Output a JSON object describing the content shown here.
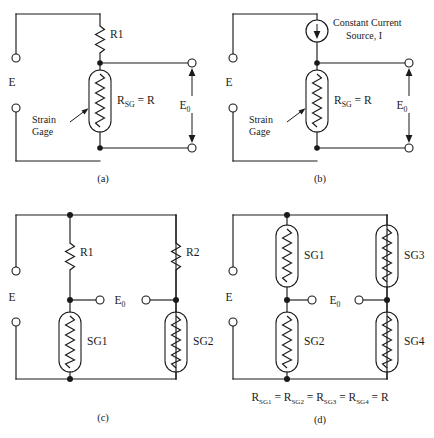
{
  "figure": {
    "background_color": "#ffffff",
    "line_color": "#1a1a1a"
  },
  "panels": [
    {
      "id": "a",
      "caption": "(a)",
      "supply_label": "E",
      "output_label": "E",
      "output_sub": "0",
      "components": [
        {
          "name": "R1",
          "type": "resistor",
          "label": "R1"
        },
        {
          "name": "strain-gage",
          "type": "strain-gage",
          "label": "R",
          "label_sub": "SG",
          "label_tail": " = R"
        }
      ],
      "annotation": {
        "line1": "Strain",
        "line2": "Gage"
      }
    },
    {
      "id": "b",
      "caption": "(b)",
      "supply_label": "E",
      "output_label": "E",
      "output_sub": "0",
      "components": [
        {
          "name": "constant-current-source",
          "type": "current-source",
          "line1": "Constant Current",
          "line2": "Source, I"
        },
        {
          "name": "strain-gage",
          "type": "strain-gage",
          "label": "R",
          "label_sub": "SG",
          "label_tail": " = R"
        }
      ],
      "annotation": {
        "line1": "Strain",
        "line2": "Gage"
      }
    },
    {
      "id": "c",
      "caption": "(c)",
      "supply_label": "E",
      "output_label": "E",
      "output_sub": "0",
      "components": [
        {
          "name": "R1",
          "type": "resistor",
          "label": "R1"
        },
        {
          "name": "R2",
          "type": "resistor",
          "label": "R2"
        },
        {
          "name": "SG1",
          "type": "strain-gage",
          "label": "SG1"
        },
        {
          "name": "SG2",
          "type": "strain-gage",
          "label": "SG2"
        }
      ]
    },
    {
      "id": "d",
      "caption": "(d)",
      "supply_label": "E",
      "output_label": "E",
      "output_sub": "0",
      "components": [
        {
          "name": "SG1",
          "type": "strain-gage",
          "label": "SG1"
        },
        {
          "name": "SG2",
          "type": "strain-gage",
          "label": "SG2"
        },
        {
          "name": "SG3",
          "type": "strain-gage",
          "label": "SG3"
        },
        {
          "name": "SG4",
          "type": "strain-gage",
          "label": "SG4"
        }
      ],
      "equation": {
        "terms": [
          {
            "base": "R",
            "sub": "SG1"
          },
          {
            "base": "R",
            "sub": "SG2"
          },
          {
            "base": "R",
            "sub": "SG3"
          },
          {
            "base": "R",
            "sub": "SG4"
          }
        ],
        "operator": "=",
        "result": "R",
        "plain": "R_SG1 = R_SG2 = R_SG3 = R_SG4 = R"
      }
    }
  ]
}
